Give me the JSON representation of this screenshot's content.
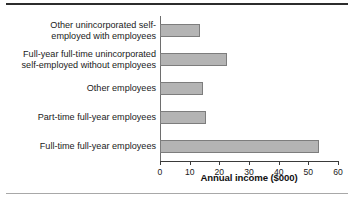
{
  "chart_data": {
    "type": "bar",
    "orientation": "horizontal",
    "title": "",
    "xlabel": "Annual income ($000)",
    "ylabel": "",
    "xlim": [
      0,
      60
    ],
    "xticks": [
      0,
      10,
      20,
      30,
      40,
      50,
      60
    ],
    "grid": false,
    "legend": null,
    "categories": [
      "Full-time full-year employees",
      "Part-time full-year employees",
      "Other employees",
      "Full-year full-time unincorporated\nself-employed without employees",
      "Other unincorporated self-\nemployed with employees"
    ],
    "values": [
      53.5,
      15.5,
      14.5,
      22.5,
      13.5
    ],
    "bar_color": "#b4b4b4",
    "bar_edge_color": "#7d7d7d"
  },
  "figure": {
    "tick_labels": [
      "0",
      "10",
      "20",
      "30",
      "40",
      "50",
      "60"
    ],
    "axis_title": "Annual income ($000)"
  }
}
